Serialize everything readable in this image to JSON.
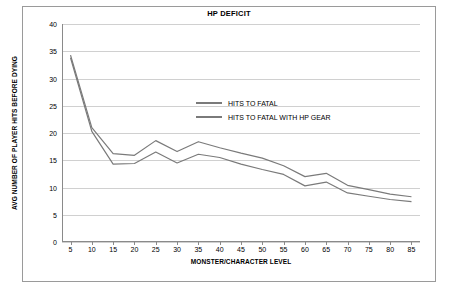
{
  "chart_data": {
    "type": "line",
    "title": "HP DEFICIT",
    "xlabel": "MONSTER/CHARACTER LEVEL",
    "ylabel": "AVG NUMBER OF PLAYER HITS BEFORE DYING",
    "x": [
      5,
      10,
      15,
      20,
      25,
      30,
      35,
      40,
      45,
      50,
      55,
      60,
      65,
      70,
      75,
      80,
      85
    ],
    "xlim": [
      3,
      87
    ],
    "ylim": [
      0,
      40
    ],
    "yticks": [
      0,
      5,
      10,
      15,
      20,
      25,
      30,
      35,
      40
    ],
    "xticks": [
      5,
      10,
      15,
      20,
      25,
      30,
      35,
      40,
      45,
      50,
      55,
      60,
      65,
      70,
      75,
      80,
      85
    ],
    "grid": true,
    "legend_position": "center-right",
    "series": [
      {
        "name": "HITS TO FATAL",
        "color": "#7a7a7a",
        "values": [
          33.8,
          20.3,
          14.3,
          14.4,
          16.5,
          14.5,
          16.1,
          15.5,
          14.3,
          13.3,
          12.4,
          10.3,
          11.0,
          9.0,
          8.4,
          7.8,
          7.4
        ]
      },
      {
        "name": "HITS TO FATAL WITH HP GEAR",
        "color": "#7a7a7a",
        "values": [
          34.3,
          21.0,
          16.2,
          15.9,
          18.6,
          16.6,
          18.4,
          17.3,
          16.3,
          15.4,
          14.0,
          12.0,
          12.6,
          10.4,
          9.6,
          8.8,
          8.3
        ]
      }
    ],
    "legend": [
      {
        "label": "HITS TO FATAL"
      },
      {
        "label": "HITS TO FATAL WITH HP GEAR"
      }
    ]
  }
}
